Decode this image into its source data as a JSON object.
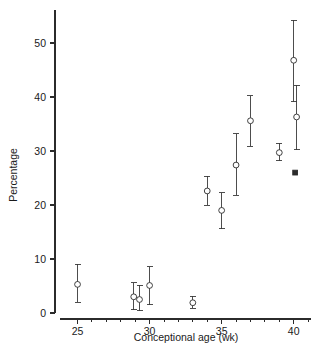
{
  "chart_data": {
    "type": "scatter",
    "title": "",
    "xlabel": "Conceptional age (wk)",
    "ylabel": "Percentage",
    "xlim": [
      24.2,
      41.2
    ],
    "ylim": [
      0,
      55
    ],
    "xticks": [
      25,
      30,
      35,
      40
    ],
    "xtick_labels": [
      "25",
      "30",
      "35",
      "40"
    ],
    "xminor_step": 1,
    "yticks": [
      0,
      10,
      20,
      30,
      40,
      50
    ],
    "ytick_labels": [
      "0",
      "10",
      "20",
      "30",
      "40",
      "50"
    ],
    "grid": false,
    "legend": "none",
    "error_bars": "vertical, capped",
    "series": [
      {
        "name": "Percentage with error bars",
        "marker": "open-circle",
        "points": [
          {
            "x": 25.0,
            "y": 5.3,
            "ylow": 2.0,
            "yhigh": 9.0
          },
          {
            "x": 28.9,
            "y": 3.0,
            "ylow": 0.6,
            "yhigh": 5.6
          },
          {
            "x": 29.3,
            "y": 2.5,
            "ylow": 0.4,
            "yhigh": 5.1
          },
          {
            "x": 30.0,
            "y": 5.1,
            "ylow": 1.5,
            "yhigh": 8.6
          },
          {
            "x": 33.0,
            "y": 1.9,
            "ylow": 0.9,
            "yhigh": 3.1
          },
          {
            "x": 34.0,
            "y": 22.6,
            "ylow": 20.0,
            "yhigh": 25.3
          },
          {
            "x": 35.0,
            "y": 19.0,
            "ylow": 15.6,
            "yhigh": 22.3
          },
          {
            "x": 36.0,
            "y": 27.4,
            "ylow": 21.8,
            "yhigh": 33.2
          },
          {
            "x": 37.0,
            "y": 35.6,
            "ylow": 30.9,
            "yhigh": 40.2
          },
          {
            "x": 39.0,
            "y": 29.7,
            "ylow": 28.2,
            "yhigh": 31.4
          },
          {
            "x": 40.0,
            "y": 46.8,
            "ylow": 39.1,
            "yhigh": 54.2
          },
          {
            "x": 40.2,
            "y": 36.3,
            "ylow": 30.2,
            "yhigh": 42.2
          }
        ]
      },
      {
        "name": "Reference point",
        "marker": "filled-square",
        "points": [
          {
            "x": 40.1,
            "y": 26.0,
            "ylow": null,
            "yhigh": null
          }
        ]
      }
    ]
  }
}
